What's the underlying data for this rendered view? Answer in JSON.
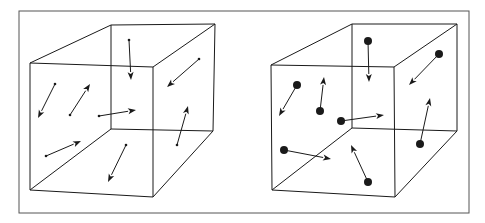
{
  "colors": {
    "background": "#ffffff",
    "line": "#1a1a1a",
    "frame": "#555555"
  },
  "frame": {
    "x": 19,
    "y": 11,
    "w": 450,
    "h": 202
  },
  "panels": [
    {
      "id": "left",
      "label": "cube-with-point-particles",
      "particle_style": "point",
      "cube": {
        "front": [
          [
            30,
            63
          ],
          [
            153,
            67
          ],
          [
            153,
            197
          ],
          [
            30,
            190
          ]
        ],
        "back": [
          [
            111,
            25
          ],
          [
            215,
            24
          ],
          [
            213,
            131
          ],
          [
            111,
            129
          ]
        ]
      },
      "arrows": [
        {
          "tail": [
            129,
            40
          ],
          "head": [
            131,
            80
          ]
        },
        {
          "tail": [
            199,
            59
          ],
          "head": [
            167,
            87
          ]
        },
        {
          "tail": [
            55,
            84
          ],
          "head": [
            38,
            118
          ]
        },
        {
          "tail": [
            70,
            115
          ],
          "head": [
            90,
            84
          ]
        },
        {
          "tail": [
            99,
            116
          ],
          "head": [
            136,
            110
          ]
        },
        {
          "tail": [
            177,
            145
          ],
          "head": [
            188,
            106
          ]
        },
        {
          "tail": [
            46,
            156
          ],
          "head": [
            81,
            141
          ]
        },
        {
          "tail": [
            126,
            145
          ],
          "head": [
            108,
            182
          ]
        }
      ]
    },
    {
      "id": "right",
      "label": "cube-with-finite-size-particles",
      "particle_style": "disc",
      "cube": {
        "front": [
          [
            271,
            65
          ],
          [
            394,
            67
          ],
          [
            395,
            197
          ],
          [
            272,
            190
          ]
        ],
        "back": [
          [
            352,
            24
          ],
          [
            457,
            24
          ],
          [
            457,
            131
          ],
          [
            352,
            128
          ]
        ]
      },
      "arrows": [
        {
          "tail": [
            368,
            41
          ],
          "head": [
            369,
            82
          ]
        },
        {
          "tail": [
            439,
            54
          ],
          "head": [
            409,
            85
          ]
        },
        {
          "tail": [
            297,
            85
          ],
          "head": [
            279,
            116
          ]
        },
        {
          "tail": [
            320,
            111
          ],
          "head": [
            324,
            77
          ]
        },
        {
          "tail": [
            341,
            121
          ],
          "head": [
            384,
            115
          ]
        },
        {
          "tail": [
            420,
            144
          ],
          "head": [
            430,
            98
          ]
        },
        {
          "tail": [
            284,
            150
          ],
          "head": [
            331,
            159
          ]
        },
        {
          "tail": [
            368,
            182
          ],
          "head": [
            351,
            145
          ]
        }
      ]
    }
  ]
}
